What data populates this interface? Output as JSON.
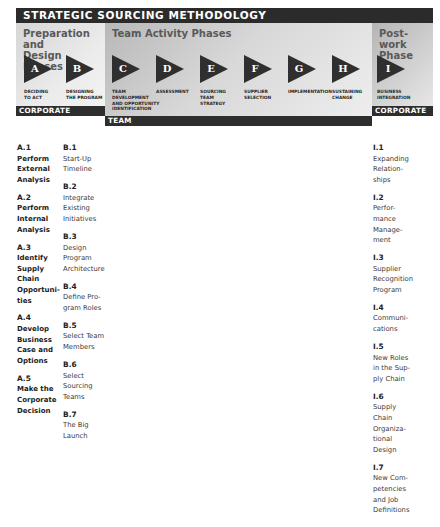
{
  "title": "STRATEGIC SOURCING METHODOLOGY",
  "panels": {
    "prep": {
      "title_line1": "Preparation and",
      "title_line2": "Design Phases",
      "bar": "CORPORATE"
    },
    "team": {
      "title": "Team Activity Phases",
      "bar": "TEAM"
    },
    "post": {
      "title_line1": "Post-work",
      "title_line2": "Phase",
      "bar": "CORPORATE"
    }
  },
  "phases": [
    {
      "letter": "A",
      "label": [
        "DECIDING",
        "TO ACT"
      ]
    },
    {
      "letter": "B",
      "label": [
        "DESIGNING",
        "THE PROGRAM"
      ]
    },
    {
      "letter": "C",
      "label": [
        "TEAM",
        "DEVELOPMENT",
        "AND OPPORTUNITY",
        "IDENTIFICATION"
      ]
    },
    {
      "letter": "D",
      "label": [
        "ASSESSMENT"
      ]
    },
    {
      "letter": "E",
      "label": [
        "SOURCING",
        "TEAM",
        "STRATEGY"
      ]
    },
    {
      "letter": "F",
      "label": [
        "SUPPLIER",
        "SELECTION"
      ]
    },
    {
      "letter": "G",
      "label": [
        "IMPLEMENTATION"
      ]
    },
    {
      "letter": "H",
      "label": [
        "SUSTAINING",
        "CHANGE"
      ]
    },
    {
      "letter": "I",
      "label": [
        "BUSINESS",
        "INTEGRATION"
      ]
    }
  ],
  "columns": {
    "A": [
      {
        "code": "A.1",
        "lines": [
          "Perform",
          "External",
          "Analysis"
        ]
      },
      {
        "code": "A.2",
        "lines": [
          "Perform",
          "Internal",
          "Analysis"
        ]
      },
      {
        "code": "A.3",
        "lines": [
          "Identify",
          "Supply",
          "Chain",
          "Opportuni-",
          "ties"
        ]
      },
      {
        "code": "A.4",
        "lines": [
          "Develop",
          "Business",
          "Case and",
          "Options"
        ]
      },
      {
        "code": "A.5",
        "lines": [
          "Make the",
          "Corporate",
          "Decision"
        ]
      }
    ],
    "B": [
      {
        "code": "B.1",
        "lines": [
          "Start-Up",
          "Timeline"
        ]
      },
      {
        "code": "B.2",
        "lines": [
          "Integrate",
          "Existing",
          "Initiatives"
        ]
      },
      {
        "code": "B.3",
        "lines": [
          "Design",
          "Program",
          "Architecture"
        ]
      },
      {
        "code": "B.4",
        "lines": [
          "Define Pro-",
          "gram Roles"
        ]
      },
      {
        "code": "B.5",
        "lines": [
          "Select Team",
          "Members"
        ]
      },
      {
        "code": "B.6",
        "lines": [
          "Select",
          "Sourcing",
          "Teams"
        ]
      },
      {
        "code": "B.7",
        "lines": [
          "The Big",
          "Launch"
        ]
      }
    ],
    "I": [
      {
        "code": "I.1",
        "lines": [
          "Expanding",
          "Relation-",
          "ships"
        ]
      },
      {
        "code": "I.2",
        "lines": [
          "Perfor-",
          "mance",
          "Manage-",
          "ment"
        ]
      },
      {
        "code": "I.3",
        "lines": [
          "Supplier",
          "Recognition",
          "Program"
        ]
      },
      {
        "code": "I.4",
        "lines": [
          "Communi-",
          "cations"
        ]
      },
      {
        "code": "I.5",
        "lines": [
          "New Roles",
          "in the Sup-",
          "ply Chain"
        ]
      },
      {
        "code": "I.6",
        "lines": [
          "Supply",
          "Chain",
          "Organiza-",
          "tional",
          "Design"
        ]
      },
      {
        "code": "I.7",
        "lines": [
          "New Com-",
          "petencies",
          "and Job",
          "Definitions"
        ]
      }
    ]
  }
}
